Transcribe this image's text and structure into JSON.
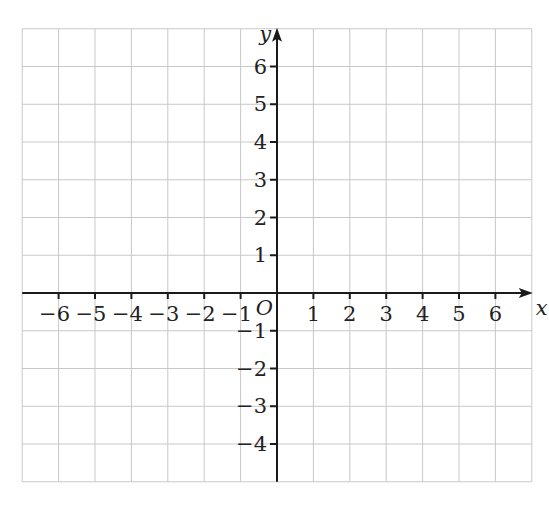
{
  "figure": {
    "type": "coordinate-plane",
    "x_axis": {
      "label": "x",
      "range": [
        -7,
        7
      ],
      "ticks": [
        -6,
        -5,
        -4,
        -3,
        -2,
        -1,
        1,
        2,
        3,
        4,
        5,
        6
      ],
      "tick_labels": [
        "−6",
        "−5",
        "−4",
        "−3",
        "−2",
        "−1",
        "1",
        "2",
        "3",
        "4",
        "5",
        "6"
      ]
    },
    "y_axis": {
      "label": "y",
      "range": [
        -5,
        7
      ],
      "ticks": [
        -4,
        -3,
        -2,
        -1,
        1,
        2,
        3,
        4,
        5,
        6
      ],
      "tick_labels": [
        "−4",
        "−3",
        "−2",
        "−1",
        "1",
        "2",
        "3",
        "4",
        "5",
        "6"
      ]
    },
    "origin_label": "O",
    "grid": true,
    "colors": {
      "grid": "#c8c8c8",
      "axis": "#1a1a1a",
      "text": "#222222"
    }
  }
}
